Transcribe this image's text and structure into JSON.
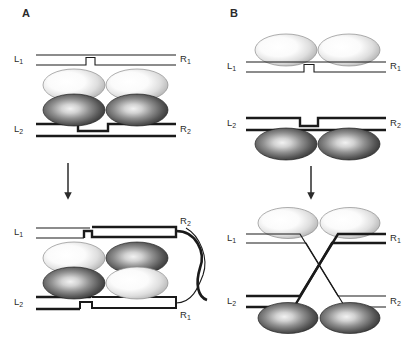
{
  "figure": {
    "type": "diagram",
    "background_color": "#ffffff",
    "line_color": "#1a1a1a",
    "panels": [
      {
        "id": "A",
        "letter": "A",
        "description": "Synaptic complex with two stacked duplexes sandwiching four protein subunits; nicked strands exchange to give a recombinant product with a crossed loop.",
        "top_stage": {
          "name": "synaptic-complex",
          "duplex_top": {
            "left_label": "L",
            "left_sub": "1",
            "right_label": "R",
            "right_sub": "1",
            "weight": "thin",
            "nicked": true
          },
          "duplex_bottom": {
            "left_label": "L",
            "left_sub": "2",
            "right_label": "R",
            "right_sub": "2",
            "weight": "thick",
            "nicked": true
          },
          "subunits": [
            {
              "row": "upper",
              "col": "left",
              "shade": "light"
            },
            {
              "row": "upper",
              "col": "right",
              "shade": "light"
            },
            {
              "row": "lower",
              "col": "left",
              "shade": "dark"
            },
            {
              "row": "lower",
              "col": "right",
              "shade": "dark"
            }
          ]
        },
        "arrow": {
          "direction": "down"
        },
        "bottom_stage": {
          "name": "recombinant-product",
          "duplex_top": {
            "left_label": "L",
            "left_sub": "1",
            "right_label": "R",
            "right_sub": "2",
            "weight": "mixed",
            "recombinant": true
          },
          "duplex_bottom": {
            "left_label": "L",
            "left_sub": "2",
            "right_label": "R",
            "right_sub": "1",
            "weight": "mixed",
            "recombinant": true
          },
          "subunits": [
            {
              "row": "upper",
              "col": "left",
              "shade": "light"
            },
            {
              "row": "upper",
              "col": "right",
              "shade": "dark"
            },
            {
              "row": "lower",
              "col": "left",
              "shade": "dark"
            },
            {
              "row": "lower",
              "col": "right",
              "shade": "light"
            }
          ],
          "crossing_strands": {
            "count": 2,
            "styles": [
              "thick",
              "thin"
            ],
            "shape": "x-crossover-loop"
          }
        }
      },
      {
        "id": "B",
        "letter": "B",
        "description": "Two separate nicked duplexes each bound by a protein dimer; strand exchange produces a crossed (Holliday-type) four-way junction.",
        "top_stage": {
          "name": "separate-duplexes",
          "duplex_top": {
            "left_label": "L",
            "left_sub": "1",
            "right_label": "R",
            "right_sub": "1",
            "weight": "thin",
            "nicked": true
          },
          "duplex_bottom": {
            "left_label": "L",
            "left_sub": "2",
            "right_label": "R",
            "right_sub": "2",
            "weight": "thick",
            "nicked": true
          },
          "subunits": [
            {
              "row": "above-top-duplex",
              "col": "left",
              "shade": "light"
            },
            {
              "row": "above-top-duplex",
              "col": "right",
              "shade": "light"
            },
            {
              "row": "below-bottom-duplex",
              "col": "left",
              "shade": "dark"
            },
            {
              "row": "below-bottom-duplex",
              "col": "right",
              "shade": "dark"
            }
          ]
        },
        "arrow": {
          "direction": "down"
        },
        "bottom_stage": {
          "name": "holliday-junction",
          "duplex_top": {
            "left_label": "L",
            "left_sub": "1",
            "right_label": "R",
            "right_sub": "1",
            "weight": "thin"
          },
          "duplex_bottom": {
            "left_label": "L",
            "left_sub": "2",
            "right_label": "R",
            "right_sub": "2",
            "weight": "thick"
          },
          "subunits": [
            {
              "row": "above-top-duplex",
              "col": "left",
              "shade": "light"
            },
            {
              "row": "above-top-duplex",
              "col": "right",
              "shade": "light"
            },
            {
              "row": "below-bottom-duplex",
              "col": "left",
              "shade": "dark"
            },
            {
              "row": "below-bottom-duplex",
              "col": "right",
              "shade": "dark"
            }
          ],
          "crossing": {
            "shape": "X",
            "strands": [
              "thin-from-top",
              "thick-from-bottom"
            ]
          }
        }
      }
    ],
    "labels": {
      "L1": "L",
      "L1_sub": "1",
      "L2": "L",
      "L2_sub": "2",
      "R1": "R",
      "R1_sub": "1",
      "R2": "R",
      "R2_sub": "2"
    },
    "colors": {
      "stroke": "#1a1a1a",
      "light_subunit_center": "#ffffff",
      "light_subunit_edge": "#9a9a9a",
      "dark_subunit_center": "#e8e8e8",
      "dark_subunit_edge": "#2a2a2a",
      "text": "#2b2b2b"
    }
  }
}
